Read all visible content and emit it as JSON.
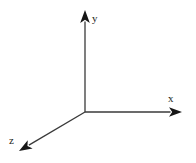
{
  "figure": {
    "background_color": "#ffffff",
    "stroke_color": "#3a3a3a",
    "label_color": "#231f20",
    "width": 196,
    "height": 163
  },
  "chart_data": {
    "type": "diagram",
    "title": "",
    "subtitle": "",
    "xlabel": "",
    "ylabel": "",
    "grid": false,
    "legend": false,
    "origin": {
      "x": 85,
      "y": 112
    },
    "axes": [
      {
        "name": "y-axis",
        "label": "y",
        "direction": "up",
        "start": {
          "x": 85,
          "y": 112
        },
        "end": {
          "x": 85,
          "y": 10
        },
        "length_px": 102,
        "angle_deg": 90,
        "arrowhead": true,
        "label_position": {
          "x": 92,
          "y": 13
        }
      },
      {
        "name": "x-axis",
        "label": "x",
        "direction": "right",
        "start": {
          "x": 85,
          "y": 112
        },
        "end": {
          "x": 182,
          "y": 112
        },
        "length_px": 97,
        "angle_deg": 0,
        "arrowhead": true,
        "label_position": {
          "x": 168,
          "y": 93
        }
      },
      {
        "name": "z-axis",
        "label": "z",
        "direction": "down-left",
        "start": {
          "x": 85,
          "y": 112
        },
        "end": {
          "x": 19,
          "y": 151
        },
        "length_px": 77,
        "angle_deg": 210.6,
        "arrowhead": true,
        "label_position": {
          "x": 9,
          "y": 135
        }
      }
    ]
  }
}
